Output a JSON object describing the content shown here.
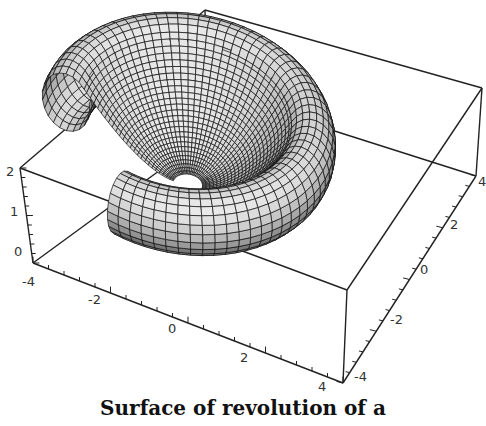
{
  "chart_data": {
    "type": "surface3d",
    "title": "Surface of revolution of a",
    "xlabel": "",
    "ylabel": "",
    "zlabel": "",
    "axes": {
      "x": {
        "ticks": [
          -4,
          -2,
          0,
          2,
          4
        ],
        "range": [
          -4,
          4
        ]
      },
      "y": {
        "ticks": [
          -4,
          -2,
          0,
          2,
          4
        ],
        "range": [
          -4,
          4
        ]
      },
      "z": {
        "ticks": [
          0,
          1,
          2
        ],
        "range": [
          0,
          2
        ]
      }
    },
    "box": true,
    "grid": false,
    "legend": null,
    "colors": {
      "surface": "#bdbdbd",
      "mesh": "#111111",
      "box": "#222222",
      "background": "#ffffff"
    }
  },
  "labels": {
    "caption": "Surface of revolution of a",
    "x_ticks": [
      "-4",
      "-2",
      "0",
      "2",
      "4"
    ],
    "y_ticks": [
      "-4",
      "-2",
      "0",
      "2",
      "4"
    ],
    "z_ticks": [
      "2",
      "1",
      "0"
    ]
  }
}
